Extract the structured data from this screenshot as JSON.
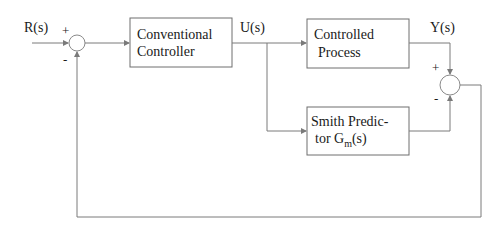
{
  "diagram": {
    "signals": {
      "input": "R(s)",
      "control": "U(s)",
      "output": "Y(s)"
    },
    "blocks": {
      "controller": {
        "line1": "Conventional",
        "line2": "Controller"
      },
      "process": {
        "line1": "Controlled",
        "line2": "Process"
      },
      "predictor": {
        "line1": "Smith Predic-",
        "line2_prefix": "tor  G",
        "line2_sub": "m",
        "line2_suffix": "(s)"
      }
    },
    "junctions": {
      "input_sum": {
        "plus": "+",
        "minus": "-"
      },
      "output_sum": {
        "plus": "+",
        "minus": "-"
      }
    },
    "colors": {
      "stroke": "#7a7a7a",
      "text": "#1a1a1a",
      "background": "#ffffff"
    }
  }
}
